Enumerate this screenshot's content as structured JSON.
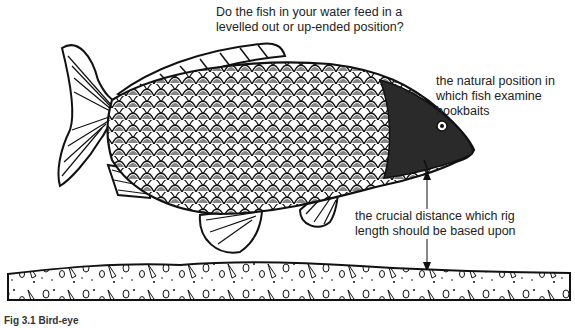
{
  "figure": {
    "question": [
      "Do the fish in your water feed in a",
      "levelled out or up-ended position?"
    ],
    "natural_position": [
      "the natural position in",
      "which fish examine",
      "hookbaits"
    ],
    "crucial_distance": [
      "the crucial distance which rig",
      "length should be based upon"
    ],
    "caption": "Fig 3.1 Bird-eye",
    "colors": {
      "ink": "#111111",
      "background": "#ffffff"
    }
  }
}
